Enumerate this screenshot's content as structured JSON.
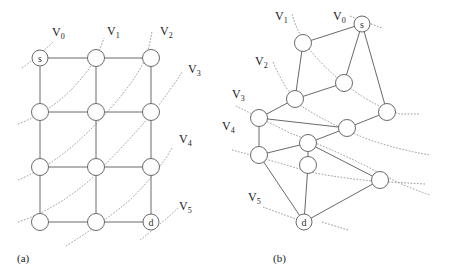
{
  "diagram": {
    "panel_a": {
      "caption": "(a)",
      "level_labels": [
        {
          "name": "V",
          "sub": "0",
          "x": 52,
          "y": 36
        },
        {
          "name": "V",
          "sub": "1",
          "x": 107,
          "y": 35
        },
        {
          "name": "V",
          "sub": "2",
          "x": 160,
          "y": 35
        },
        {
          "name": "V",
          "sub": "3",
          "x": 188,
          "y": 73
        },
        {
          "name": "V",
          "sub": "4",
          "x": 179,
          "y": 143
        },
        {
          "name": "V",
          "sub": "5",
          "x": 179,
          "y": 210
        }
      ],
      "nodes": [
        {
          "id": "s",
          "label": "s",
          "x": 40,
          "y": 58
        },
        {
          "id": "a01",
          "label": "",
          "x": 96,
          "y": 58
        },
        {
          "id": "a02",
          "label": "",
          "x": 151,
          "y": 58
        },
        {
          "id": "a10",
          "label": "",
          "x": 40,
          "y": 112
        },
        {
          "id": "a11",
          "label": "",
          "x": 96,
          "y": 112
        },
        {
          "id": "a12",
          "label": "",
          "x": 151,
          "y": 112
        },
        {
          "id": "a20",
          "label": "",
          "x": 40,
          "y": 167
        },
        {
          "id": "a21",
          "label": "",
          "x": 96,
          "y": 167
        },
        {
          "id": "a22",
          "label": "",
          "x": 151,
          "y": 167
        },
        {
          "id": "a30",
          "label": "",
          "x": 40,
          "y": 222
        },
        {
          "id": "a31",
          "label": "",
          "x": 96,
          "y": 222
        },
        {
          "id": "d",
          "label": "d",
          "x": 151,
          "y": 222
        }
      ],
      "edges": [
        [
          "s",
          "a01"
        ],
        [
          "a01",
          "a02"
        ],
        [
          "a10",
          "a11"
        ],
        [
          "a11",
          "a12"
        ],
        [
          "a20",
          "a21"
        ],
        [
          "a21",
          "a22"
        ],
        [
          "a30",
          "a31"
        ],
        [
          "a31",
          "d"
        ],
        [
          "s",
          "a10"
        ],
        [
          "a10",
          "a20"
        ],
        [
          "a20",
          "a30"
        ],
        [
          "a01",
          "a11"
        ],
        [
          "a11",
          "a21"
        ],
        [
          "a21",
          "a31"
        ],
        [
          "a02",
          "a12"
        ],
        [
          "a12",
          "a22"
        ],
        [
          "a22",
          "d"
        ]
      ]
    },
    "panel_b": {
      "caption": "(b)",
      "level_labels": [
        {
          "name": "V",
          "sub": "0",
          "x": 333,
          "y": 20
        },
        {
          "name": "V",
          "sub": "1",
          "x": 275,
          "y": 20
        },
        {
          "name": "V",
          "sub": "2",
          "x": 255,
          "y": 65
        },
        {
          "name": "V",
          "sub": "3",
          "x": 232,
          "y": 98
        },
        {
          "name": "V",
          "sub": "4",
          "x": 222,
          "y": 130
        },
        {
          "name": "V",
          "sub": "5",
          "x": 248,
          "y": 201
        }
      ],
      "nodes": [
        {
          "id": "s",
          "label": "s",
          "x": 362,
          "y": 24
        },
        {
          "id": "b1",
          "label": "",
          "x": 303,
          "y": 43
        },
        {
          "id": "b2",
          "label": "",
          "x": 344,
          "y": 83
        },
        {
          "id": "b3",
          "label": "",
          "x": 295,
          "y": 99
        },
        {
          "id": "b4",
          "label": "",
          "x": 387,
          "y": 112
        },
        {
          "id": "b5",
          "label": "",
          "x": 259,
          "y": 118
        },
        {
          "id": "b6",
          "label": "",
          "x": 347,
          "y": 128
        },
        {
          "id": "b7",
          "label": "",
          "x": 308,
          "y": 143
        },
        {
          "id": "b8",
          "label": "",
          "x": 259,
          "y": 155
        },
        {
          "id": "b9",
          "label": "",
          "x": 308,
          "y": 165
        },
        {
          "id": "b10",
          "label": "",
          "x": 380,
          "y": 180
        },
        {
          "id": "d",
          "label": "d",
          "x": 304,
          "y": 222
        }
      ],
      "edges": [
        [
          "s",
          "b1"
        ],
        [
          "s",
          "b2"
        ],
        [
          "s",
          "b4"
        ],
        [
          "b1",
          "b3"
        ],
        [
          "b2",
          "b3"
        ],
        [
          "b3",
          "b5"
        ],
        [
          "b5",
          "b6"
        ],
        [
          "b6",
          "b4"
        ],
        [
          "b5",
          "b8"
        ],
        [
          "b8",
          "b7"
        ],
        [
          "b7",
          "b6"
        ],
        [
          "b7",
          "b9"
        ],
        [
          "b7",
          "b10"
        ],
        [
          "b8",
          "d"
        ],
        [
          "b9",
          "d"
        ],
        [
          "b10",
          "d"
        ]
      ]
    }
  }
}
